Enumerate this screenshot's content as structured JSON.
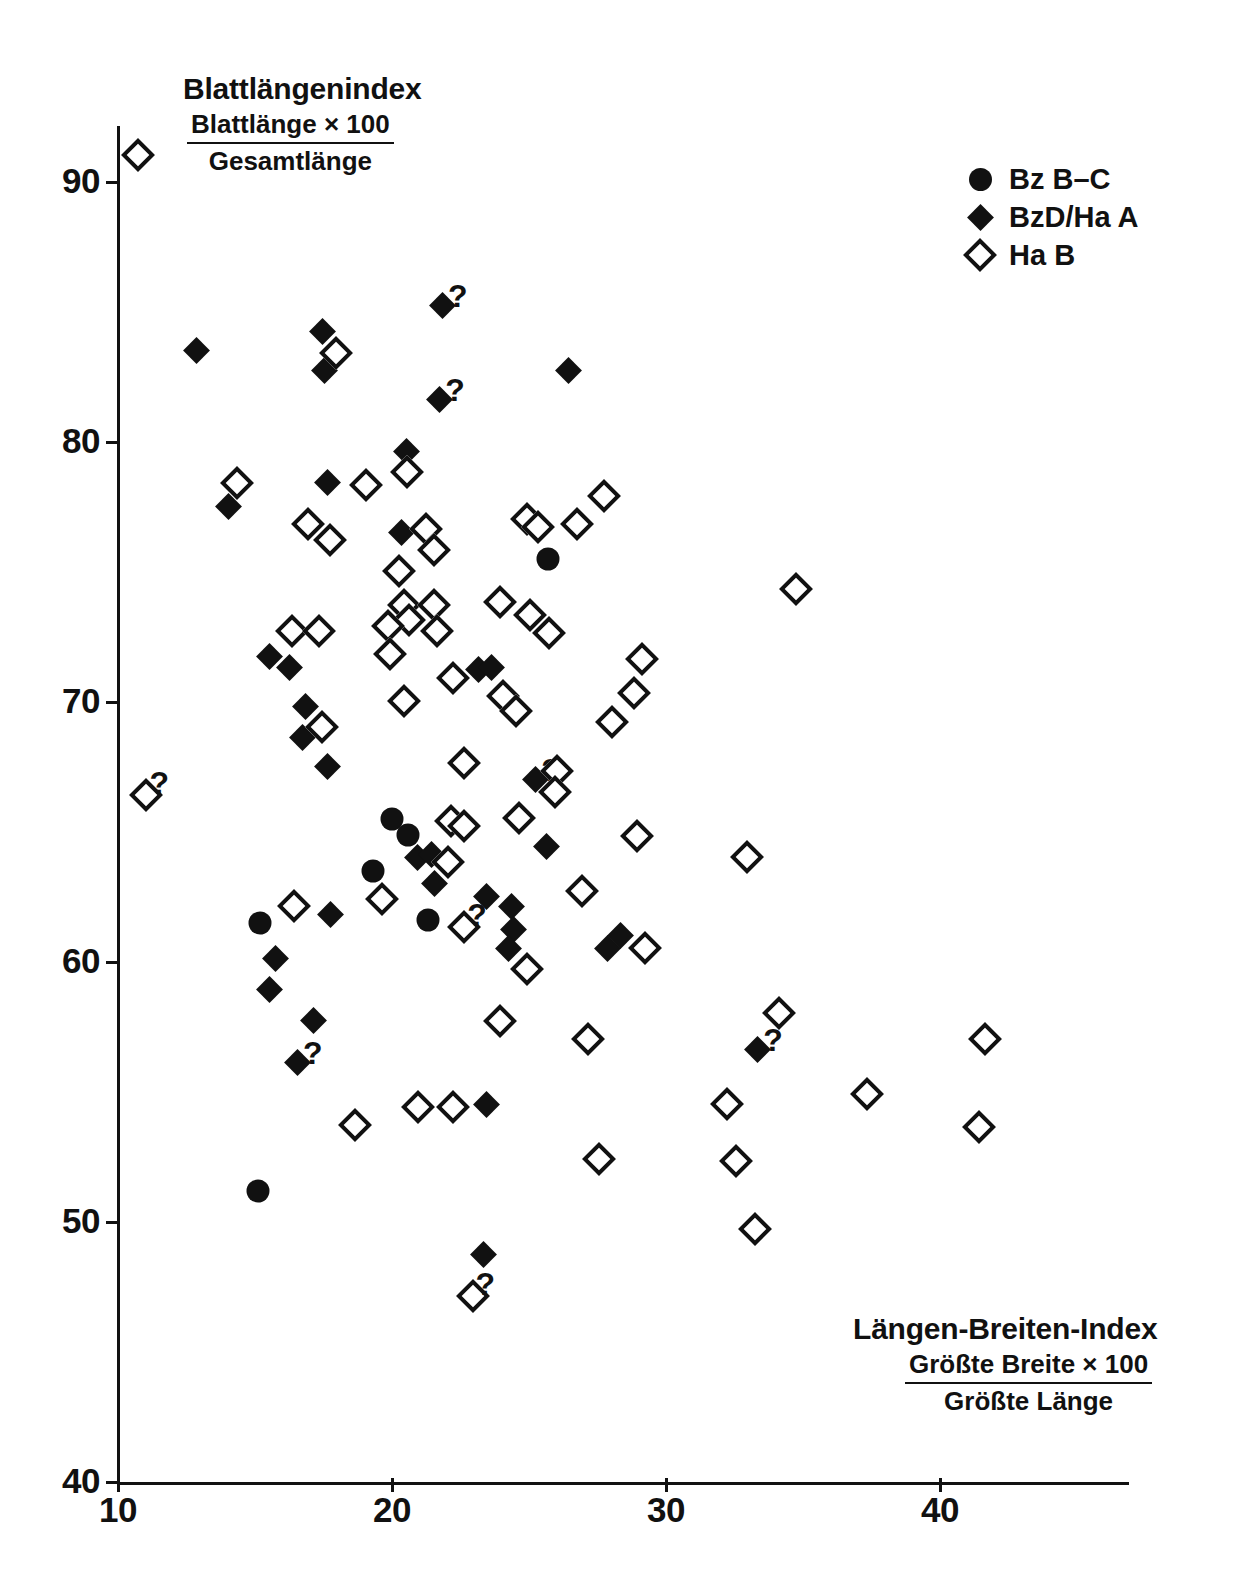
{
  "chart_data": {
    "type": "scatter",
    "title": "",
    "xlabel": "Längen-Breiten-Index",
    "xlabel_fraction_numerator": "Größte Breite × 100",
    "xlabel_fraction_denominator": "Größte Länge",
    "ylabel": "Blattlängenindex",
    "ylabel_fraction_numerator": "Blattlänge × 100",
    "ylabel_fraction_denominator": "Gesamtlänge",
    "xlim": [
      10,
      47
    ],
    "ylim": [
      40,
      93
    ],
    "xticks": [
      10,
      20,
      30,
      40
    ],
    "yticks": [
      40,
      50,
      60,
      70,
      80,
      90
    ],
    "xtick_labels": [
      "10",
      "20",
      "30",
      "40"
    ],
    "ytick_labels": [
      "40",
      "50",
      "60",
      "70",
      "80",
      "90"
    ],
    "grid": false,
    "legend_position": "top-right",
    "marker_color": "#111111",
    "background_color": "#ffffff",
    "series": [
      {
        "name": "Bz B-C",
        "marker": "filled-circle",
        "points": [
          {
            "x": 15.2,
            "y": 61.5
          },
          {
            "x": 19.3,
            "y": 63.5
          },
          {
            "x": 20.0,
            "y": 65.5
          },
          {
            "x": 20.6,
            "y": 64.9
          },
          {
            "x": 21.3,
            "y": 61.6
          },
          {
            "x": 15.1,
            "y": 51.2
          },
          {
            "x": 25.7,
            "y": 75.5
          }
        ]
      },
      {
        "name": "BzD/Ha A",
        "marker": "filled-diamond",
        "points": [
          {
            "x": 12.5,
            "y": 83.9
          },
          {
            "x": 13.7,
            "y": 77.9
          },
          {
            "x": 17.1,
            "y": 84.6
          },
          {
            "x": 17.2,
            "y": 83.1
          },
          {
            "x": 17.3,
            "y": 78.8
          },
          {
            "x": 20.2,
            "y": 80.0
          },
          {
            "x": 20.0,
            "y": 76.9
          },
          {
            "x": 21.5,
            "y": 85.6,
            "note": "?"
          },
          {
            "x": 21.4,
            "y": 82.0,
            "note": "?"
          },
          {
            "x": 26.1,
            "y": 83.1
          },
          {
            "x": 15.2,
            "y": 72.1
          },
          {
            "x": 15.9,
            "y": 71.7
          },
          {
            "x": 16.5,
            "y": 70.2
          },
          {
            "x": 16.4,
            "y": 69.0
          },
          {
            "x": 17.3,
            "y": 67.9
          },
          {
            "x": 22.8,
            "y": 71.6
          },
          {
            "x": 23.3,
            "y": 71.7
          },
          {
            "x": 24.9,
            "y": 67.4,
            "note": "?"
          },
          {
            "x": 25.3,
            "y": 64.8
          },
          {
            "x": 20.6,
            "y": 64.4
          },
          {
            "x": 21.1,
            "y": 64.5
          },
          {
            "x": 21.2,
            "y": 63.4
          },
          {
            "x": 23.1,
            "y": 62.9
          },
          {
            "x": 24.0,
            "y": 62.5
          },
          {
            "x": 24.1,
            "y": 61.6
          },
          {
            "x": 23.9,
            "y": 60.9
          },
          {
            "x": 17.4,
            "y": 62.2
          },
          {
            "x": 15.4,
            "y": 60.5
          },
          {
            "x": 15.2,
            "y": 59.3
          },
          {
            "x": 16.8,
            "y": 58.1
          },
          {
            "x": 16.2,
            "y": 56.5,
            "note": "?"
          },
          {
            "x": 27.5,
            "y": 60.9
          },
          {
            "x": 28.0,
            "y": 61.4
          },
          {
            "x": 33.0,
            "y": 57.0,
            "note": "?"
          },
          {
            "x": 23.1,
            "y": 54.9
          },
          {
            "x": 23.0,
            "y": 49.1
          }
        ]
      },
      {
        "name": "Ha B",
        "marker": "open-diamond",
        "points": [
          {
            "x": 10.3,
            "y": 91.5
          },
          {
            "x": 17.5,
            "y": 83.9
          },
          {
            "x": 13.9,
            "y": 78.9
          },
          {
            "x": 18.6,
            "y": 78.8
          },
          {
            "x": 20.1,
            "y": 79.3
          },
          {
            "x": 27.3,
            "y": 78.4
          },
          {
            "x": 16.5,
            "y": 77.3
          },
          {
            "x": 17.3,
            "y": 76.7
          },
          {
            "x": 20.8,
            "y": 77.1
          },
          {
            "x": 21.1,
            "y": 76.3
          },
          {
            "x": 24.5,
            "y": 77.5
          },
          {
            "x": 24.9,
            "y": 77.2
          },
          {
            "x": 26.3,
            "y": 77.3
          },
          {
            "x": 19.8,
            "y": 75.5
          },
          {
            "x": 20.0,
            "y": 74.2
          },
          {
            "x": 20.2,
            "y": 73.6
          },
          {
            "x": 21.1,
            "y": 74.2
          },
          {
            "x": 21.2,
            "y": 73.2
          },
          {
            "x": 23.5,
            "y": 74.3
          },
          {
            "x": 24.6,
            "y": 73.8
          },
          {
            "x": 25.3,
            "y": 73.1
          },
          {
            "x": 34.3,
            "y": 74.8
          },
          {
            "x": 15.9,
            "y": 73.2
          },
          {
            "x": 16.9,
            "y": 73.2
          },
          {
            "x": 19.4,
            "y": 73.4
          },
          {
            "x": 19.5,
            "y": 72.3
          },
          {
            "x": 21.8,
            "y": 71.4
          },
          {
            "x": 20.0,
            "y": 70.5
          },
          {
            "x": 23.6,
            "y": 70.7
          },
          {
            "x": 24.1,
            "y": 70.1
          },
          {
            "x": 28.7,
            "y": 72.1
          },
          {
            "x": 28.4,
            "y": 70.8
          },
          {
            "x": 27.6,
            "y": 69.7
          },
          {
            "x": 17.0,
            "y": 69.5
          },
          {
            "x": 22.2,
            "y": 68.1
          },
          {
            "x": 25.6,
            "y": 67.8
          },
          {
            "x": 25.5,
            "y": 67.0
          },
          {
            "x": 10.6,
            "y": 66.9,
            "note": "?"
          },
          {
            "x": 21.7,
            "y": 65.9
          },
          {
            "x": 22.2,
            "y": 65.7
          },
          {
            "x": 24.2,
            "y": 66.0
          },
          {
            "x": 28.5,
            "y": 65.3
          },
          {
            "x": 32.5,
            "y": 64.5
          },
          {
            "x": 19.2,
            "y": 62.9
          },
          {
            "x": 16.0,
            "y": 62.6
          },
          {
            "x": 21.6,
            "y": 64.3
          },
          {
            "x": 26.5,
            "y": 63.2
          },
          {
            "x": 22.2,
            "y": 61.8,
            "note": "?"
          },
          {
            "x": 28.8,
            "y": 61.0
          },
          {
            "x": 24.5,
            "y": 60.2
          },
          {
            "x": 23.5,
            "y": 58.2
          },
          {
            "x": 33.7,
            "y": 58.5
          },
          {
            "x": 26.7,
            "y": 57.5
          },
          {
            "x": 41.2,
            "y": 57.5
          },
          {
            "x": 36.9,
            "y": 55.4
          },
          {
            "x": 31.8,
            "y": 55.0
          },
          {
            "x": 20.5,
            "y": 54.9
          },
          {
            "x": 21.8,
            "y": 54.9
          },
          {
            "x": 18.2,
            "y": 54.2
          },
          {
            "x": 41.0,
            "y": 54.1
          },
          {
            "x": 27.1,
            "y": 52.9
          },
          {
            "x": 32.1,
            "y": 52.8
          },
          {
            "x": 32.8,
            "y": 50.2
          },
          {
            "x": 22.5,
            "y": 47.6,
            "note": "?"
          }
        ]
      }
    ]
  },
  "legend": {
    "items": [
      {
        "label": "Bz B–C",
        "marker": "filled-circle"
      },
      {
        "label": "BzD/Ha A",
        "marker": "filled-diamond"
      },
      {
        "label": "Ha B",
        "marker": "open-diamond"
      }
    ]
  },
  "annotations": {
    "question_mark": "?"
  }
}
